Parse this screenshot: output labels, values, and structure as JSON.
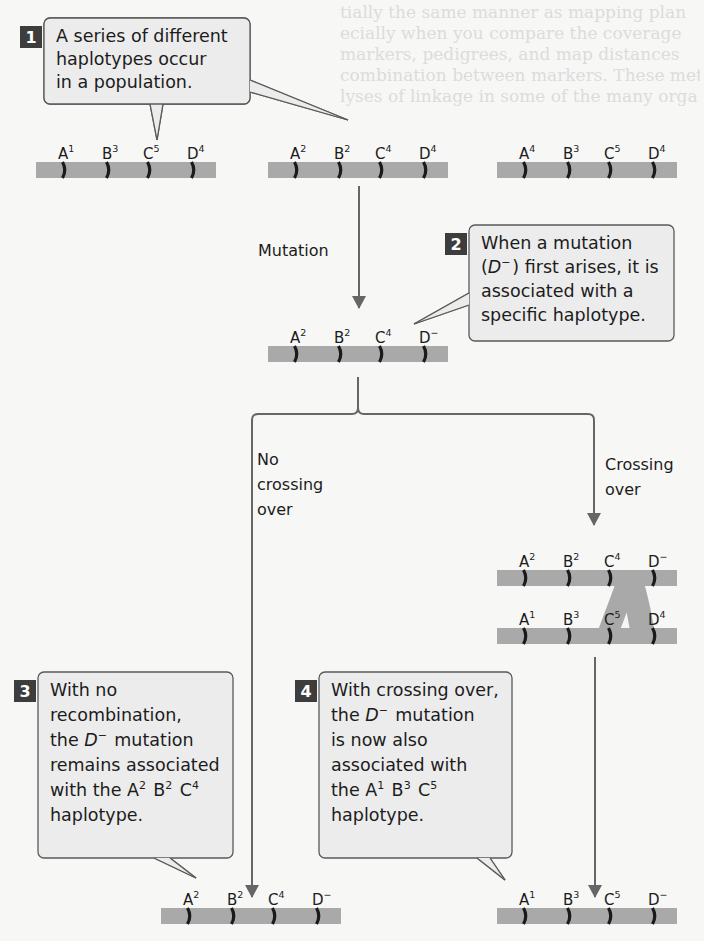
{
  "figure": {
    "background_color": "#f7f7f6",
    "colors": {
      "chromosome": "#a9a9a9",
      "marker": "#1a1a1a",
      "arrow": "#666666",
      "callout_fill": "#ececec",
      "callout_border": "#5a5a5a",
      "step_badge": "#3d3d3d"
    },
    "steps": [
      {
        "number": "1",
        "lines": [
          "A series of different",
          "haplotypes occur",
          "in a population."
        ]
      },
      {
        "number": "2",
        "lines": [
          "When a mutation",
          "(D⁻) first arises, it is",
          "associated with a",
          "specific haplotype."
        ]
      },
      {
        "number": "3",
        "lines": [
          "With no",
          "recombination,",
          "the D⁻ mutation",
          "remains associated",
          "with the A² B² C⁴",
          "haplotype."
        ]
      },
      {
        "number": "4",
        "lines": [
          "With crossing over,",
          "the D⁻ mutation",
          "is now also",
          "associated with",
          "the A¹ B³ C⁵",
          "haplotype."
        ]
      }
    ],
    "process_labels": {
      "mutation": "Mutation",
      "no_crossing": [
        "No",
        "crossing",
        "over"
      ],
      "crossing": [
        "Crossing",
        "over"
      ]
    },
    "chromosomes": {
      "population_1": [
        {
          "locus": "A",
          "allele": "1"
        },
        {
          "locus": "B",
          "allele": "3"
        },
        {
          "locus": "C",
          "allele": "5"
        },
        {
          "locus": "D",
          "allele": "4"
        }
      ],
      "population_2": [
        {
          "locus": "A",
          "allele": "2"
        },
        {
          "locus": "B",
          "allele": "2"
        },
        {
          "locus": "C",
          "allele": "4"
        },
        {
          "locus": "D",
          "allele": "4"
        }
      ],
      "population_3": [
        {
          "locus": "A",
          "allele": "4"
        },
        {
          "locus": "B",
          "allele": "3"
        },
        {
          "locus": "C",
          "allele": "5"
        },
        {
          "locus": "D",
          "allele": "4"
        }
      ],
      "mutated": [
        {
          "locus": "A",
          "allele": "2"
        },
        {
          "locus": "B",
          "allele": "2"
        },
        {
          "locus": "C",
          "allele": "4"
        },
        {
          "locus": "D",
          "allele": "−"
        }
      ],
      "crossover_top": [
        {
          "locus": "A",
          "allele": "2"
        },
        {
          "locus": "B",
          "allele": "2"
        },
        {
          "locus": "C",
          "allele": "4"
        },
        {
          "locus": "D",
          "allele": "−"
        }
      ],
      "crossover_bottom": [
        {
          "locus": "A",
          "allele": "1"
        },
        {
          "locus": "B",
          "allele": "3"
        },
        {
          "locus": "C",
          "allele": "5"
        },
        {
          "locus": "D",
          "allele": "4"
        }
      ],
      "result_no_crossing": [
        {
          "locus": "A",
          "allele": "2"
        },
        {
          "locus": "B",
          "allele": "2"
        },
        {
          "locus": "C",
          "allele": "4"
        },
        {
          "locus": "D",
          "allele": "−"
        }
      ],
      "result_crossing": [
        {
          "locus": "A",
          "allele": "1"
        },
        {
          "locus": "B",
          "allele": "3"
        },
        {
          "locus": "C",
          "allele": "5"
        },
        {
          "locus": "D",
          "allele": "−"
        }
      ]
    },
    "background_text_lines": [
      "tially the same manner as mapping plan",
      "ecially when you compare the coverage",
      "markers, pedigrees, and map distances",
      "combination between markers. These meth",
      "lyses of linkage in some of the many orga"
    ]
  }
}
